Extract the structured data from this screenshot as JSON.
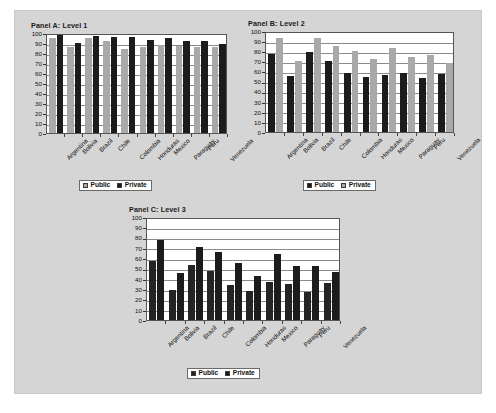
{
  "figure": {
    "background_color": "#d5d5d5",
    "plot_background_color": "#ffffff"
  },
  "colors": {
    "light_gray_series": "#a9a9a9",
    "dark_series": "#1c1c1c",
    "gridline": "#8a8a8a",
    "axis": "#555555"
  },
  "legend_labels": {
    "public": "Public",
    "private": "Private"
  },
  "chart_data": [
    {
      "type": "bar",
      "title": "Panel A:  Level 1",
      "xlabel": "",
      "ylabel": "",
      "ylim": [
        0,
        100
      ],
      "yticks": [
        0,
        10,
        20,
        30,
        40,
        50,
        60,
        70,
        80,
        90,
        100
      ],
      "grid": true,
      "legend_position": "bottom",
      "categories": [
        "Argentina",
        "Bolivia",
        "Brazil",
        "Chile",
        "Colombia",
        "Honduras",
        "Mexico",
        "Paraguay",
        "Peru",
        "Venezuela"
      ],
      "series": [
        {
          "name": "Public",
          "color": "#a9a9a9",
          "values": [
            95,
            86,
            95,
            92,
            84,
            86,
            88,
            87,
            86,
            86
          ]
        },
        {
          "name": "Private",
          "color": "#1c1c1c",
          "values": [
            100,
            90,
            97,
            96,
            96,
            93,
            95,
            92,
            92,
            89
          ]
        }
      ]
    },
    {
      "type": "bar",
      "title": "Panel B:  Level 2",
      "xlabel": "",
      "ylabel": "",
      "ylim": [
        0,
        100
      ],
      "yticks": [
        0,
        10,
        20,
        30,
        40,
        50,
        60,
        70,
        80,
        90,
        100
      ],
      "grid": true,
      "legend_position": "bottom",
      "categories": [
        "Argentina",
        "Bolivia",
        "Brazil",
        "Chile",
        "Colombia",
        "Honduras",
        "Mexico",
        "Paraguay",
        "Peru",
        "Venezuela"
      ],
      "series": [
        {
          "name": "Public",
          "color": "#1c1c1c",
          "values": [
            77,
            55,
            79,
            70,
            58,
            54,
            56,
            58,
            53,
            57
          ]
        },
        {
          "name": "Private",
          "color": "#a9a9a9",
          "values": [
            93,
            70,
            93,
            85,
            80,
            72,
            83,
            74,
            76,
            68
          ]
        }
      ]
    },
    {
      "type": "bar",
      "title": "Panel C:  Level 3",
      "xlabel": "",
      "ylabel": "",
      "ylim": [
        0,
        100
      ],
      "yticks": [
        0,
        10,
        20,
        30,
        40,
        50,
        60,
        70,
        80,
        90,
        100
      ],
      "grid": true,
      "legend_position": "bottom",
      "categories": [
        "Argentina",
        "Bolivia",
        "Brazil",
        "Chile",
        "Colombia",
        "Honduras",
        "Mexico",
        "Paraguay",
        "Peru",
        "Venezuela"
      ],
      "series": [
        {
          "name": "Public",
          "color": "#242424",
          "values": [
            57,
            29,
            53,
            48,
            34,
            28,
            37,
            35,
            27,
            36
          ]
        },
        {
          "name": "Private",
          "color": "#1c1c1c",
          "values": [
            78,
            46,
            71,
            66,
            55,
            43,
            64,
            52,
            52,
            47
          ]
        }
      ]
    }
  ]
}
